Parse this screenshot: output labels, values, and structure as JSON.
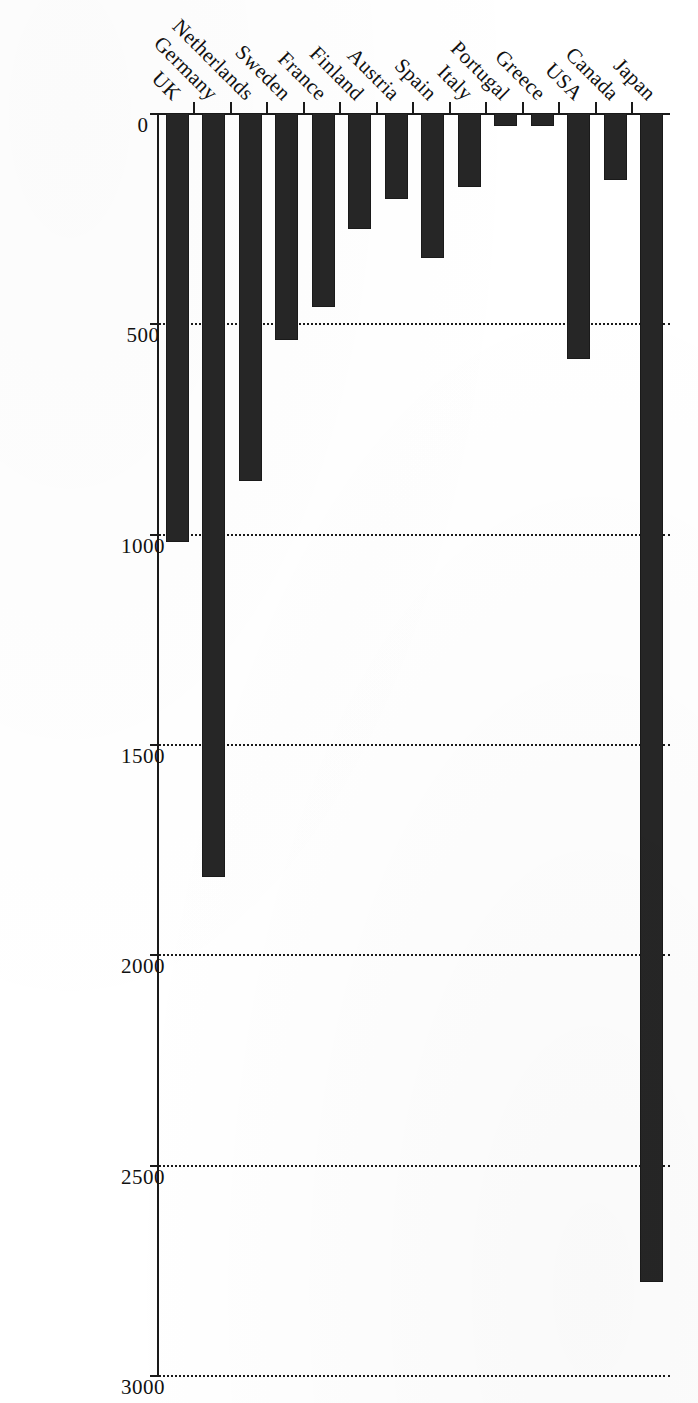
{
  "chart_data": {
    "type": "bar",
    "orientation": "vertical-bars-rendered-sideways",
    "title": "",
    "subtitle": "",
    "xlabel": "",
    "ylabel": "",
    "categories": [
      "UK",
      "Germany",
      "Netherlands",
      "Sweden",
      "France",
      "Finland",
      "Austria",
      "Spain",
      "Italy",
      "Portugal",
      "Greece",
      "USA",
      "Canada",
      "Japan"
    ],
    "values": [
      1020,
      1815,
      875,
      540,
      460,
      275,
      205,
      345,
      175,
      30,
      30,
      585,
      160,
      2780
    ],
    "ylim": [
      0,
      3000
    ],
    "yticks": [
      0,
      500,
      1000,
      1500,
      2000,
      2500,
      3000
    ],
    "ytick_labels": [
      "0",
      "500",
      "1000",
      "1500",
      "2000",
      "2500",
      "3000"
    ],
    "grid": "dotted-vertical-at-value-ticks",
    "legend": "none",
    "bar_color": "#262626",
    "axis_color": "#1a1a1a",
    "background": "#ffffff"
  },
  "axis": {
    "value_ticks": [
      {
        "label": "3000",
        "value": 3000
      },
      {
        "label": "2500",
        "value": 2500
      },
      {
        "label": "2000",
        "value": 2000
      },
      {
        "label": "1500",
        "value": 1500
      },
      {
        "label": "1000",
        "value": 1000
      },
      {
        "label": "500",
        "value": 500
      },
      {
        "label": "0",
        "value": 0
      }
    ]
  },
  "bars": [
    {
      "label": "UK",
      "value": 1020
    },
    {
      "label": "Germany",
      "value": 1815
    },
    {
      "label": "Netherlands",
      "value": 875
    },
    {
      "label": "Sweden",
      "value": 540
    },
    {
      "label": "France",
      "value": 460
    },
    {
      "label": "Finland",
      "value": 275
    },
    {
      "label": "Austria",
      "value": 205
    },
    {
      "label": "Spain",
      "value": 345
    },
    {
      "label": "Italy",
      "value": 175
    },
    {
      "label": "Portugal",
      "value": 30
    },
    {
      "label": "Greece",
      "value": 30
    },
    {
      "label": "USA",
      "value": 585
    },
    {
      "label": "Canada",
      "value": 160
    },
    {
      "label": "Japan",
      "value": 2780
    }
  ]
}
